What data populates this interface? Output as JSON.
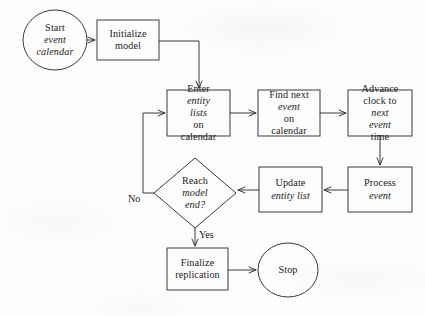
{
  "diagram": {
    "stroke_color": "#3a3a3a",
    "text_color": "#1c1c1c",
    "background_color": "#fdfdfd",
    "nodes": {
      "start": {
        "shape": "ellipse",
        "line1": "Start",
        "line2": "event",
        "line3": "calendar"
      },
      "initialize": {
        "shape": "rect",
        "line1": "Initialize",
        "line2": "model"
      },
      "enter_lists": {
        "shape": "rect",
        "line1a": "Enter ",
        "line1b": "entity",
        "line2a": "lists",
        "line2b": " on",
        "line3": "calendar"
      },
      "find_event": {
        "shape": "rect",
        "line1": "Find next",
        "line2a": "event",
        "line2b": " on",
        "line3": "calendar"
      },
      "advance_clock": {
        "shape": "rect",
        "line1": "Advance",
        "line2a": "clock to ",
        "line2b": "next",
        "line3a": "event",
        "line3b": " time"
      },
      "process_event": {
        "shape": "rect",
        "line1": "Process",
        "line2": "event"
      },
      "update_entity": {
        "shape": "rect",
        "line1": "Update",
        "line2": "entity list"
      },
      "decision": {
        "shape": "diamond",
        "line1": "Reach",
        "line2": "model",
        "line3": "end?"
      },
      "finalize": {
        "shape": "rect",
        "line1": "Finalize",
        "line2": "replication"
      },
      "stop": {
        "shape": "ellipse",
        "line1": "Stop"
      }
    },
    "edge_labels": {
      "no": "No",
      "yes": "Yes"
    }
  }
}
